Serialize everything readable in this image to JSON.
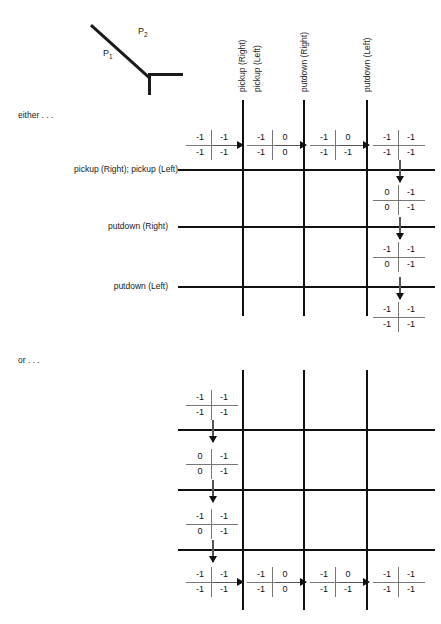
{
  "figure": {
    "name": "two-link-arm-diagram",
    "segment_labels": [
      {
        "id": "p1",
        "text": "P",
        "sub": "1"
      },
      {
        "id": "p2",
        "text": "P",
        "sub": "2"
      }
    ]
  },
  "columns": [
    {
      "id": "pickup-right",
      "label": "pickup (Right)"
    },
    {
      "id": "pickup-left",
      "label": "pickup (Left)"
    },
    {
      "id": "putdown-right",
      "label": "putdown (Right)"
    },
    {
      "id": "putdown-left",
      "label": "putdown (Left)"
    }
  ],
  "sections": [
    {
      "id": "either",
      "label": "either . . ."
    },
    {
      "id": "or",
      "label": "or . . ."
    }
  ],
  "row_labels": [
    {
      "id": "pickup-right-then-left",
      "label": "pickup (Right); pickup (Left)"
    },
    {
      "id": "putdown-right",
      "label": "putdown (Right)"
    },
    {
      "id": "putdown-left",
      "label": "putdown (Left)"
    }
  ],
  "matrices": {
    "either_row": [
      {
        "id": "e1",
        "values": [
          [
            "-1",
            "-1"
          ],
          [
            "-1",
            "-1"
          ]
        ],
        "marker": "none"
      },
      {
        "id": "e2",
        "values": [
          [
            "-1",
            "0"
          ],
          [
            "-1",
            "0"
          ]
        ],
        "marker": "nail-down"
      },
      {
        "id": "e3",
        "values": [
          [
            "-1",
            "0"
          ],
          [
            "-1",
            "-1"
          ]
        ],
        "marker": "nail-down"
      },
      {
        "id": "e4",
        "values": [
          [
            "-1",
            "-1"
          ],
          [
            "-1",
            "-1"
          ]
        ],
        "marker": "none"
      }
    ],
    "either_col": [
      {
        "id": "e5",
        "values": [
          [
            "0",
            "-1"
          ],
          [
            "0",
            "-1"
          ]
        ],
        "marker": "none"
      },
      {
        "id": "e6",
        "values": [
          [
            "-1",
            "-1"
          ],
          [
            "0",
            "-1"
          ]
        ],
        "marker": "none"
      },
      {
        "id": "e7",
        "values": [
          [
            "-1",
            "-1"
          ],
          [
            "-1",
            "-1"
          ]
        ],
        "marker": "none"
      }
    ],
    "or_col": [
      {
        "id": "o1",
        "values": [
          [
            "-1",
            "-1"
          ],
          [
            "-1",
            "-1"
          ]
        ],
        "marker": "none"
      },
      {
        "id": "o2",
        "values": [
          [
            "0",
            "-1"
          ],
          [
            "0",
            "-1"
          ]
        ],
        "marker": "nail-right"
      },
      {
        "id": "o3",
        "values": [
          [
            "-1",
            "-1"
          ],
          [
            "0",
            "-1"
          ]
        ],
        "marker": "nail-right"
      }
    ],
    "or_row": [
      {
        "id": "o4",
        "values": [
          [
            "-1",
            "-1"
          ],
          [
            "-1",
            "-1"
          ]
        ],
        "marker": "none"
      },
      {
        "id": "o5",
        "values": [
          [
            "-1",
            "0"
          ],
          [
            "-1",
            "0"
          ]
        ],
        "marker": "none"
      },
      {
        "id": "o6",
        "values": [
          [
            "-1",
            "0"
          ],
          [
            "-1",
            "-1"
          ]
        ],
        "marker": "none"
      },
      {
        "id": "o7",
        "values": [
          [
            "-1",
            "-1"
          ],
          [
            "-1",
            "-1"
          ]
        ],
        "marker": "none"
      }
    ]
  },
  "colors": {
    "ink": "#111111",
    "rule": "#777777",
    "arrow": "#555555",
    "background": "#ffffff"
  }
}
